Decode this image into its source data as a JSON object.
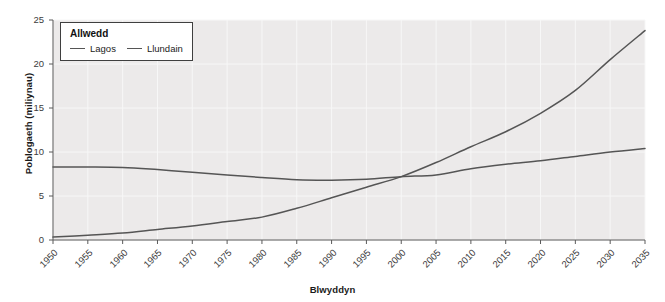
{
  "chart_data": {
    "type": "line",
    "title": "",
    "xlabel": "Blwyddyn",
    "ylabel": "Poblogaeth (miliynau)",
    "xlim": [
      1950,
      2035
    ],
    "ylim": [
      0,
      25
    ],
    "grid": true,
    "legend_position": "top-left",
    "legend_title": "Allwedd",
    "xticks": [
      1950,
      1955,
      1960,
      1965,
      1970,
      1975,
      1980,
      1985,
      1990,
      1995,
      2000,
      2005,
      2010,
      2015,
      2020,
      2025,
      2030,
      2035
    ],
    "yticks": [
      0,
      5,
      10,
      15,
      20,
      25
    ],
    "x": [
      1950,
      1955,
      1960,
      1965,
      1970,
      1975,
      1980,
      1985,
      1990,
      1995,
      2000,
      2005,
      2010,
      2015,
      2020,
      2025,
      2030,
      2035
    ],
    "series": [
      {
        "name": "Lagos",
        "color": "#555555",
        "values": [
          0.33,
          0.55,
          0.8,
          1.2,
          1.6,
          2.1,
          2.6,
          3.6,
          4.8,
          6.0,
          7.2,
          8.8,
          10.6,
          12.3,
          14.4,
          17.0,
          20.5,
          23.8
        ]
      },
      {
        "name": "Llundain",
        "color": "#555555",
        "values": [
          8.3,
          8.3,
          8.25,
          8.0,
          7.7,
          7.4,
          7.1,
          6.85,
          6.8,
          6.9,
          7.2,
          7.4,
          8.1,
          8.6,
          9.0,
          9.5,
          10.0,
          10.4
        ]
      }
    ],
    "annotations": [],
    "colors": {
      "plot_background": "#eceaea",
      "gridline": "#f7f7f7",
      "axis": "#5a5a5a",
      "text": "#3c3c3c",
      "line": "#555555"
    }
  },
  "legend": {
    "title": "Allwedd",
    "entries": [
      {
        "label": "Lagos"
      },
      {
        "label": "Llundain"
      }
    ]
  }
}
